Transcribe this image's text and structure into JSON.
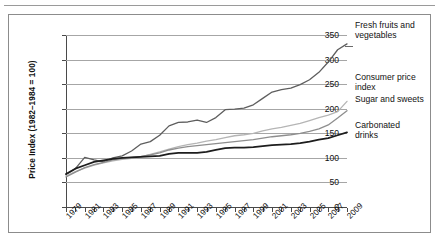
{
  "chart_data": {
    "type": "line",
    "title": "",
    "xlabel": "",
    "ylabel": "Price Index (1982–1984 = 100)",
    "ylim": [
      0,
      350
    ],
    "ytick_values": [
      0,
      50,
      100,
      150,
      200,
      250,
      300,
      350
    ],
    "ytick_labels": [
      "0",
      "50",
      "100",
      "150",
      "200",
      "250",
      "300",
      "350"
    ],
    "grid": true,
    "legend_position": "right-inline-labels",
    "x": [
      1979,
      1980,
      1981,
      1982,
      1983,
      1984,
      1985,
      1986,
      1987,
      1988,
      1989,
      1990,
      1991,
      1992,
      1993,
      1994,
      1995,
      1996,
      1997,
      1998,
      1999,
      2000,
      2001,
      2002,
      2003,
      2004,
      2005,
      2006,
      2007,
      2008,
      2009
    ],
    "xtick_labels": [
      "1979",
      "1981",
      "1983",
      "1985",
      "1987",
      "1989",
      "1991",
      "1993",
      "1995",
      "1997",
      "1999",
      "2001",
      "2003",
      "2005",
      "2007",
      "2009"
    ],
    "series": [
      {
        "name": "Fresh fruits and vegetables",
        "color": "#5e5e5e",
        "width": 1.3,
        "values": [
          66,
          78,
          101,
          96,
          92,
          100,
          104,
          114,
          128,
          133,
          146,
          165,
          172,
          173,
          177,
          172,
          182,
          198,
          199,
          201,
          208,
          221,
          234,
          239,
          242,
          249,
          259,
          274,
          295,
          320,
          332
        ]
      },
      {
        "name": "Consumer price index",
        "color": "#b5b5b5",
        "width": 1.3,
        "values": [
          63,
          72,
          79,
          85,
          90,
          94,
          97,
          99,
          102,
          107,
          112,
          118,
          123,
          127,
          130,
          134,
          137,
          141,
          145,
          147,
          150,
          155,
          159,
          162,
          166,
          170,
          176,
          182,
          187,
          194,
          215
        ]
      },
      {
        "name": "Sugar and sweets",
        "color": "#8e8e8e",
        "width": 1.3,
        "values": [
          61,
          71,
          80,
          86,
          91,
          96,
          99,
          101,
          103,
          106,
          110,
          116,
          120,
          123,
          125,
          127,
          129,
          131,
          133,
          135,
          137,
          140,
          143,
          145,
          147,
          150,
          154,
          159,
          167,
          181,
          196
        ]
      },
      {
        "name": "Carbonated drinks",
        "color": "#1d1d1d",
        "width": 1.8,
        "values": [
          67,
          78,
          85,
          92,
          95,
          98,
          100,
          101,
          102,
          103,
          104,
          108,
          110,
          110,
          110,
          112,
          116,
          120,
          121,
          121,
          122,
          124,
          126,
          127,
          128,
          130,
          133,
          137,
          140,
          146,
          152
        ]
      }
    ]
  },
  "labels": {
    "fresh_fruits_line1": "Fresh fruits and",
    "fresh_fruits_line2": "vegetables",
    "cpi_line1": "Consumer price",
    "cpi_line2": "index",
    "sugar_line1": "Sugar and sweets",
    "carbonated_line1": "Carbonated",
    "carbonated_line2": "drinks"
  }
}
